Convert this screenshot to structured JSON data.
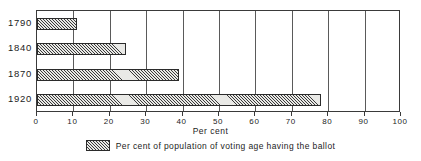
{
  "chart_data": {
    "type": "bar",
    "orientation": "horizontal",
    "title": "",
    "subtitle": "",
    "xlabel": "Per cent",
    "ylabel": "",
    "categories": [
      "1790",
      "1840",
      "1870",
      "1920"
    ],
    "values": [
      11,
      24.5,
      39,
      78
    ],
    "series": [
      {
        "name": "Per cent of population of voting age having the ballot",
        "values": [
          11,
          24.5,
          39,
          78
        ]
      }
    ],
    "xlim": [
      0,
      100
    ],
    "xticks": [
      0,
      10,
      20,
      30,
      40,
      50,
      60,
      70,
      80,
      90,
      100
    ],
    "xticklabels": [
      "0",
      "10",
      "20",
      "30",
      "40",
      "50",
      "60",
      "70",
      "80",
      "90",
      "100"
    ],
    "grid": "vertical",
    "legend_position": "bottom-center",
    "legend": [
      {
        "label": "Per cent of population of voting age having the ballot",
        "swatch": "hatched-diagonal"
      }
    ],
    "annotations": [],
    "colors": {
      "bar_fill": "#e9e9e6",
      "bar_hatch": "#3a3a3a",
      "bar_outline": "#2b2b2b",
      "gridline": "#5a5a5a",
      "frame": "#3a3a3a",
      "text": "#1c1c1c",
      "background": "#ffffff"
    }
  },
  "axis": {
    "x_title": "Per cent"
  },
  "legend": {
    "entry_label": "Per cent of population of voting age having the ballot"
  }
}
